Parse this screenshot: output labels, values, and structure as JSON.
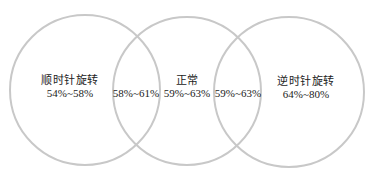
{
  "diagram": {
    "type": "venn",
    "stroke_color": "#c8c8c8",
    "text_color": "#222222",
    "circles": [
      {
        "id": "clockwise",
        "label": "顺时针旋转",
        "range": "54%~58%",
        "cx": 85,
        "cy": 90,
        "r": 75
      },
      {
        "id": "normal",
        "label": "正常",
        "range": "59%~63%",
        "cx": 187,
        "cy": 91,
        "r": 74
      },
      {
        "id": "counterclockwise",
        "label": "逆时针旋转",
        "range": "64%~80%",
        "cx": 289,
        "cy": 92,
        "r": 75
      }
    ],
    "overlaps": [
      {
        "id": "clockwise-normal",
        "range": "58%~61%"
      },
      {
        "id": "normal-counterclockwise",
        "range": "59%~63%"
      }
    ]
  }
}
